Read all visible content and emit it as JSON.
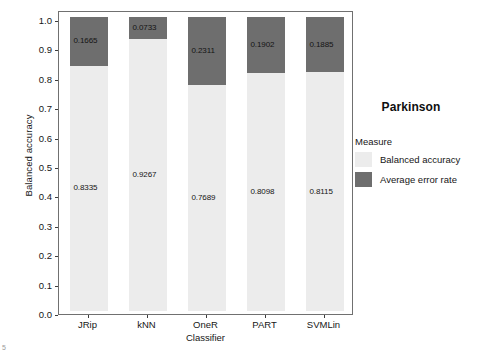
{
  "chart_data": {
    "type": "bar",
    "subtype": "stacked",
    "title": "Parkinson",
    "xlabel": "Classifier",
    "ylabel": "Balanced accuracy",
    "categories": [
      "JRip",
      "kNN",
      "OneR",
      "PART",
      "SVMLin"
    ],
    "series": [
      {
        "name": "Balanced accuracy",
        "color": "#ececec",
        "values": [
          0.8335,
          0.9267,
          0.7689,
          0.8098,
          0.8115
        ],
        "labels": [
          "0.8335",
          "0.9267",
          "0.7689",
          "0.8098",
          "0.8115"
        ]
      },
      {
        "name": "Average error rate",
        "color": "#6e6e6e",
        "values": [
          0.1665,
          0.0733,
          0.2311,
          0.1902,
          0.1885
        ],
        "labels": [
          "0.1665",
          "0.0733",
          "0.2311",
          "0.1902",
          "0.1885"
        ]
      }
    ],
    "ylim": [
      0.0,
      1.0
    ],
    "yticks": [
      "0.0",
      "0.1",
      "0.2",
      "0.3",
      "0.4",
      "0.5",
      "0.6",
      "0.7",
      "0.8",
      "0.9",
      "1.0"
    ],
    "ytick_values": [
      0.0,
      0.1,
      0.2,
      0.3,
      0.4,
      0.5,
      0.6,
      0.7,
      0.8,
      0.9,
      1.0
    ],
    "grid": false,
    "legend_position": "right"
  },
  "legend": {
    "title": "Parkinson",
    "subtitle": "Measure",
    "items": [
      {
        "label": "Balanced accuracy",
        "color": "#ececec"
      },
      {
        "label": "Average error rate",
        "color": "#6e6e6e"
      }
    ]
  },
  "axes": {
    "y_title": "Balanced accuracy",
    "x_title": "Classifier"
  },
  "artifact": {
    "page_mark": "5"
  }
}
